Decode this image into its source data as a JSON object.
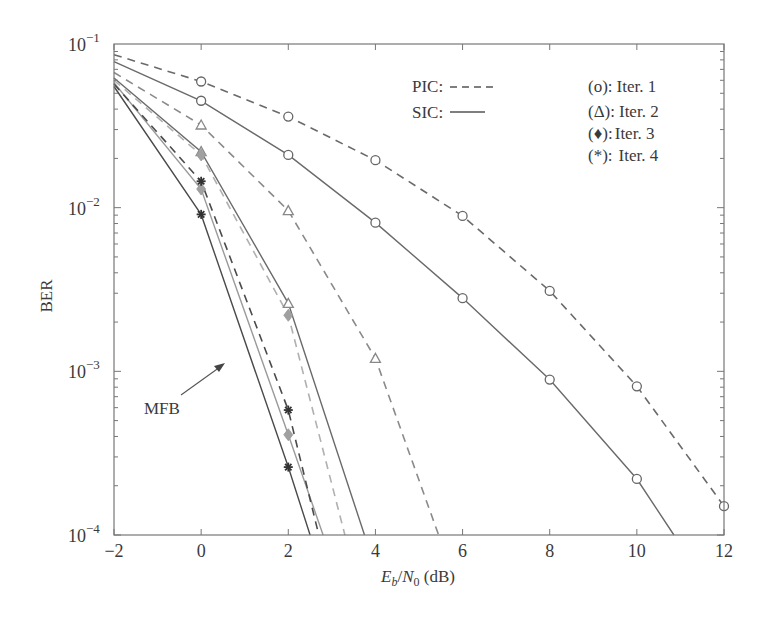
{
  "chart_data": {
    "type": "line",
    "title": "",
    "xlabel": "E_b/N_0 (dB)",
    "xlabel_parts": {
      "E": "E",
      "b": "b",
      "slash": "/",
      "N": "N",
      "zero": "0",
      "unit": " (dB)"
    },
    "ylabel": "BER",
    "yscale": "log",
    "xlim": [
      -2,
      12
    ],
    "ylim": [
      0.0001,
      0.1
    ],
    "xticks": [
      -2,
      0,
      2,
      4,
      6,
      8,
      10,
      12
    ],
    "xtick_labels": [
      "−2",
      "0",
      "2",
      "4",
      "6",
      "8",
      "10",
      "12"
    ],
    "yticks": [
      0.1,
      0.01,
      0.001,
      0.0001
    ],
    "ytick_labels": [
      {
        "base": "10",
        "exp": "−1"
      },
      {
        "base": "10",
        "exp": "−2"
      },
      {
        "base": "10",
        "exp": "−3"
      },
      {
        "base": "10",
        "exp": "−4"
      }
    ],
    "grid": false,
    "legend": {
      "position": "upper right",
      "line_styles": [
        {
          "label": "PIC:",
          "style": "dashed"
        },
        {
          "label": "SIC:",
          "style": "solid"
        }
      ],
      "markers": [
        {
          "symbol": "(o):",
          "label": "Iter. 1"
        },
        {
          "symbol": "(Δ):",
          "label": "Iter. 2"
        },
        {
          "symbol": "(♦):",
          "label": "Iter. 3"
        },
        {
          "symbol": "(*):",
          "label": "Iter. 4"
        }
      ]
    },
    "annotations": [
      {
        "text": "MFB",
        "arrow": true
      }
    ],
    "series": [
      {
        "name": "PIC Iter. 1",
        "style": "dashed",
        "marker": "circle",
        "color": "#6a6a6a",
        "x": [
          -2,
          0,
          2,
          4,
          6,
          8,
          10,
          12
        ],
        "values": [
          0.086,
          0.059,
          0.036,
          0.0195,
          0.0089,
          0.0031,
          0.00081,
          0.00015
        ],
        "marker_x": [
          0,
          2,
          4,
          6,
          8,
          10,
          12
        ]
      },
      {
        "name": "SIC Iter. 1",
        "style": "solid",
        "marker": "circle",
        "color": "#6a6a6a",
        "x": [
          -2,
          0,
          2,
          4,
          6,
          8,
          10,
          10.85
        ],
        "values": [
          0.078,
          0.045,
          0.021,
          0.0081,
          0.0028,
          0.00089,
          0.00022,
          0.0001
        ],
        "marker_x": [
          0,
          2,
          4,
          6,
          8,
          10
        ]
      },
      {
        "name": "PIC Iter. 2",
        "style": "dashed",
        "marker": "triangle",
        "color": "#8a8a8a",
        "x": [
          -2,
          0,
          2,
          4,
          5.45
        ],
        "values": [
          0.067,
          0.032,
          0.0096,
          0.0012,
          0.0001
        ],
        "marker_x": [
          0,
          2,
          4
        ]
      },
      {
        "name": "SIC Iter. 2",
        "style": "solid",
        "marker": "triangle",
        "color": "#6a6a6a",
        "x": [
          -2,
          0,
          2,
          3.75
        ],
        "values": [
          0.062,
          0.022,
          0.0026,
          0.0001
        ],
        "marker_x": [
          0,
          2
        ]
      },
      {
        "name": "PIC Iter. 3",
        "style": "dashed",
        "marker": "diamond",
        "color": "#b0b0b0",
        "x": [
          -2,
          0,
          2,
          3.3
        ],
        "values": [
          0.06,
          0.021,
          0.0022,
          0.0001
        ],
        "marker_x": [
          0,
          2
        ]
      },
      {
        "name": "SIC Iter. 3",
        "style": "solid",
        "marker": "diamond",
        "color": "#9a9a9a",
        "x": [
          -2,
          0,
          2,
          2.8
        ],
        "values": [
          0.058,
          0.013,
          0.00041,
          0.0001
        ],
        "marker_x": [
          0,
          2
        ]
      },
      {
        "name": "PIC Iter. 4",
        "style": "dashed",
        "marker": "star",
        "color": "#4a4a4a",
        "x": [
          -2,
          0,
          2,
          2.7
        ],
        "values": [
          0.057,
          0.0145,
          0.00058,
          0.0001
        ],
        "marker_x": [
          0,
          2
        ]
      },
      {
        "name": "SIC Iter. 4 / MFB",
        "style": "solid",
        "marker": "star",
        "color": "#4a4a4a",
        "x": [
          -2,
          0,
          2,
          2.5
        ],
        "values": [
          0.055,
          0.0091,
          0.00026,
          0.0001
        ],
        "marker_x": [
          0,
          2
        ]
      }
    ]
  }
}
